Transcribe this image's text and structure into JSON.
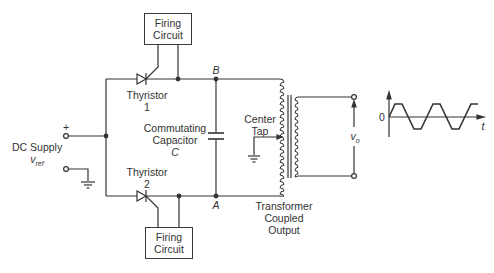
{
  "diagram": {
    "type": "circuit-schematic",
    "blocks": {
      "firing_circuit_top": {
        "line1": "Firing",
        "line2": "Circuit"
      },
      "firing_circuit_bottom": {
        "line1": "Firing",
        "line2": "Circuit"
      }
    },
    "components": {
      "thyristor1": {
        "line1": "Thyristor",
        "line2": "1"
      },
      "thyristor2": {
        "line1": "Thyristor",
        "line2": "2"
      },
      "capacitor": {
        "line1": "Commutating",
        "line2": "Capacitor",
        "line3": "C"
      },
      "center_tap": {
        "line1": "Center",
        "line2": "Tap"
      },
      "transformer": {
        "line1": "Transformer",
        "line2": "Coupled",
        "line3": "Output"
      }
    },
    "nodes": {
      "B": "B",
      "A": "A"
    },
    "input": {
      "plus": "+",
      "label": "DC Supply",
      "symbol": "v",
      "subscript": "ref"
    },
    "output": {
      "symbol": "v",
      "subscript": "o"
    },
    "waveform": {
      "origin_label": "0",
      "axis_label": "t",
      "shape": "trapezoidal square wave",
      "cycles": 2.5
    }
  }
}
